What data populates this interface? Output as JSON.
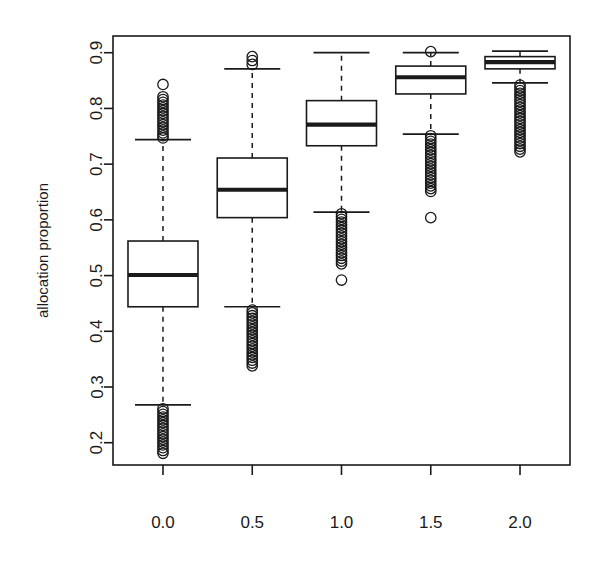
{
  "figure": {
    "background_color": "#ffffff",
    "ink_color": "#1a1a1a",
    "width": 616,
    "height": 572
  },
  "chart_data": {
    "type": "box",
    "title": "",
    "subtitle": "",
    "xlabel": "",
    "ylabel": "allocation proportion",
    "grid": false,
    "legend": "none",
    "xtick_labels": [
      "0.0",
      "0.5",
      "1.0",
      "1.5",
      "2.0"
    ],
    "x": [
      0.0,
      0.5,
      1.0,
      1.5,
      2.0
    ],
    "ytick_labels": [
      "0.2",
      "0.3",
      "0.4",
      "0.5",
      "0.6",
      "0.7",
      "0.8",
      "0.9"
    ],
    "yticks": [
      0.2,
      0.3,
      0.4,
      0.5,
      0.6,
      0.7,
      0.8,
      0.9
    ],
    "ylim": [
      0.16,
      0.93
    ],
    "xlim": [
      -0.28,
      2.28
    ],
    "boxes": [
      {
        "category": "0.0",
        "x": 0.0,
        "whisker_low": 0.268,
        "q1": 0.444,
        "median": 0.501,
        "q3": 0.562,
        "whisker_high": 0.744,
        "outliers_low": [
          0.181,
          0.186,
          0.191,
          0.196,
          0.201,
          0.206,
          0.211,
          0.216,
          0.221,
          0.226,
          0.231,
          0.236,
          0.241,
          0.246,
          0.251,
          0.256,
          0.261
        ],
        "outliers_high": [
          0.843,
          0.821,
          0.816,
          0.811,
          0.806,
          0.801,
          0.796,
          0.791,
          0.786,
          0.781,
          0.776,
          0.771,
          0.766,
          0.761,
          0.756,
          0.751,
          0.747
        ]
      },
      {
        "category": "0.5",
        "x": 0.5,
        "whisker_low": 0.444,
        "q1": 0.604,
        "median": 0.654,
        "q3": 0.711,
        "whisker_high": 0.871,
        "outliers_low": [
          0.338,
          0.343,
          0.348,
          0.353,
          0.358,
          0.363,
          0.368,
          0.373,
          0.378,
          0.383,
          0.388,
          0.393,
          0.398,
          0.403,
          0.408,
          0.413,
          0.418,
          0.423,
          0.428,
          0.433,
          0.438
        ],
        "outliers_high": [
          0.893,
          0.886,
          0.879
        ]
      },
      {
        "category": "1.0",
        "x": 1.0,
        "whisker_low": 0.614,
        "q1": 0.733,
        "median": 0.771,
        "q3": 0.814,
        "whisker_high": 0.9,
        "outliers_low": [
          0.492,
          0.521,
          0.526,
          0.531,
          0.536,
          0.541,
          0.546,
          0.551,
          0.556,
          0.561,
          0.566,
          0.571,
          0.576,
          0.581,
          0.586,
          0.591,
          0.596,
          0.601,
          0.606,
          0.611
        ],
        "outliers_high": []
      },
      {
        "category": "1.5",
        "x": 1.5,
        "whisker_low": 0.754,
        "q1": 0.826,
        "median": 0.856,
        "q3": 0.876,
        "whisker_high": 0.9,
        "outliers_low": [
          0.604,
          0.651,
          0.656,
          0.661,
          0.666,
          0.671,
          0.676,
          0.681,
          0.686,
          0.691,
          0.696,
          0.701,
          0.706,
          0.711,
          0.716,
          0.721,
          0.726,
          0.731,
          0.736,
          0.741,
          0.746,
          0.751
        ],
        "outliers_high": [
          0.902
        ]
      },
      {
        "category": "2.0",
        "x": 2.0,
        "whisker_low": 0.846,
        "q1": 0.871,
        "median": 0.883,
        "q3": 0.893,
        "whisker_high": 0.903,
        "outliers_low": [
          0.722,
          0.727,
          0.732,
          0.737,
          0.742,
          0.747,
          0.752,
          0.757,
          0.762,
          0.767,
          0.772,
          0.777,
          0.782,
          0.787,
          0.792,
          0.797,
          0.802,
          0.807,
          0.812,
          0.817,
          0.822,
          0.827,
          0.832,
          0.837,
          0.842
        ],
        "outliers_high": []
      }
    ]
  }
}
